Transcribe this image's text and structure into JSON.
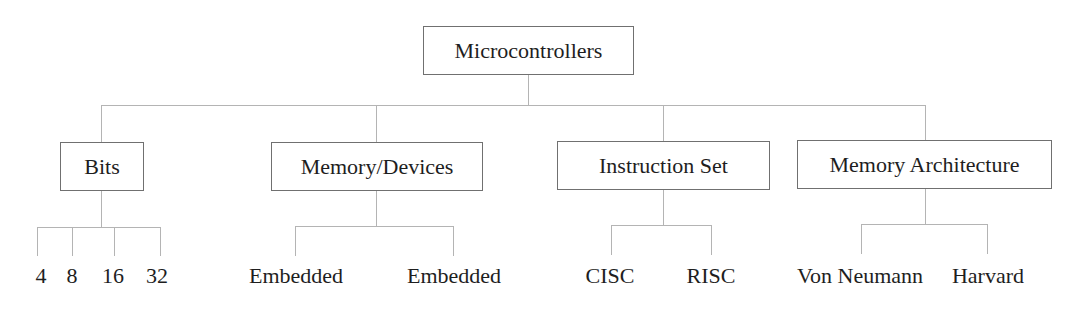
{
  "diagram": {
    "type": "tree",
    "root": {
      "label": "Microcontrollers"
    },
    "categories": [
      {
        "label": "Bits",
        "children": [
          "4",
          "8",
          "16",
          "32"
        ]
      },
      {
        "label": "Memory/Devices",
        "children": [
          "Embedded",
          "Embedded"
        ]
      },
      {
        "label": "Instruction Set",
        "children": [
          "CISC",
          "RISC"
        ]
      },
      {
        "label": "Memory Architecture",
        "children": [
          "Von Neumann",
          "Harvard"
        ]
      }
    ]
  },
  "colors": {
    "connector": "#b4b4b4",
    "box_border": "#707070",
    "text": "#1e1e1e",
    "background": "#ffffff"
  }
}
